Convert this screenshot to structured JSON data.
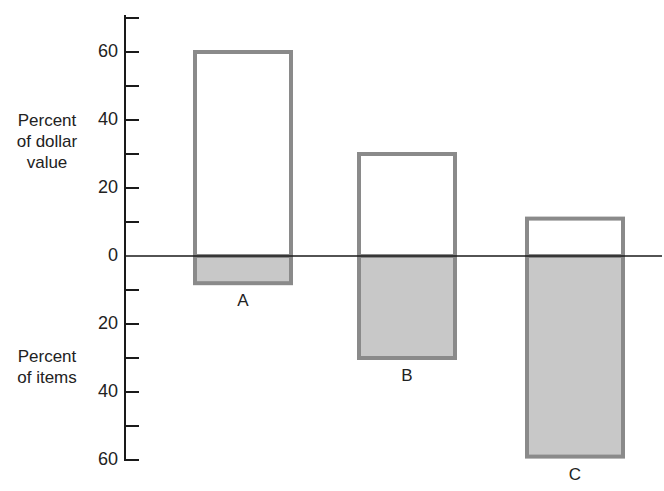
{
  "chart_data": {
    "type": "bar",
    "title": "",
    "xlabel": "",
    "ylabel_top": "Percent of dollar value",
    "ylabel_bottom": "Percent of items",
    "categories": [
      "A",
      "B",
      "C"
    ],
    "series": [
      {
        "name": "Percent of dollar value",
        "direction": "up",
        "values": [
          60,
          30,
          11
        ],
        "fill": "#ffffff"
      },
      {
        "name": "Percent of items",
        "direction": "down",
        "values": [
          8,
          30,
          59
        ],
        "fill": "#c8c8c8"
      }
    ],
    "yticks_top": [
      0,
      20,
      40,
      60
    ],
    "yticks_bottom": [
      20,
      40,
      60
    ],
    "minor_tick_step": 10,
    "ylim": [
      -60,
      70
    ],
    "grid": false,
    "legend": "none",
    "colors": {
      "bar_border": "#8a8a8a",
      "item_fill": "#c8c8c8",
      "value_fill": "#ffffff",
      "axis": "#1a1a1a"
    }
  },
  "labels": {
    "top_axis": [
      "Percent",
      "of dollar",
      "value"
    ],
    "bottom_axis": [
      "Percent",
      "of items"
    ]
  }
}
